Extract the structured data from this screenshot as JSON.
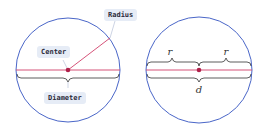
{
  "left_diagram": {
    "labels": {
      "radius": "Radius",
      "center": "Center",
      "diameter": "Diameter"
    }
  },
  "right_diagram": {
    "labels": {
      "r_left": "r",
      "r_right": "r",
      "d": "d"
    }
  },
  "colors": {
    "circle": "#4a66c8",
    "line": "#d0406a",
    "center_dot": "#b0204a",
    "brace": "#333333",
    "label_bg": "#e6ecf6"
  }
}
